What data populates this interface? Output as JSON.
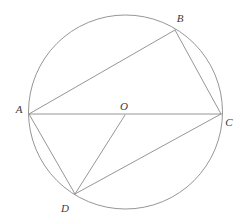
{
  "figure": {
    "background_color": "#ffffff",
    "stroke_color": "#8a8a8a",
    "label_color": "#3a3a3a",
    "stroke_width": 0.9
  },
  "circle": {
    "name": "circumscribed-circle",
    "cx": 125.5,
    "cy": 112,
    "r": 97
  },
  "points": [
    {
      "id": "A",
      "label": "A",
      "x": 29,
      "y": 114,
      "label_x": 19,
      "label_y": 113,
      "role": "vertex"
    },
    {
      "id": "B",
      "label": "B",
      "x": 175,
      "y": 30,
      "label_x": 180,
      "label_y": 22,
      "role": "vertex"
    },
    {
      "id": "C",
      "label": "C",
      "x": 221,
      "y": 114,
      "label_x": 229,
      "label_y": 126,
      "role": "vertex"
    },
    {
      "id": "D",
      "label": "D",
      "x": 75,
      "y": 194,
      "label_x": 65,
      "label_y": 212,
      "role": "vertex"
    },
    {
      "id": "O",
      "label": "O",
      "x": 125,
      "y": 115,
      "label_x": 124,
      "label_y": 110,
      "role": "center"
    }
  ],
  "segments": [
    {
      "name": "segment-AB",
      "from": "A",
      "to": "B",
      "x1": 29,
      "y1": 114,
      "x2": 175,
      "y2": 30
    },
    {
      "name": "segment-BC",
      "from": "B",
      "to": "C",
      "x1": 175,
      "y1": 30,
      "x2": 221,
      "y2": 114
    },
    {
      "name": "segment-AC",
      "from": "A",
      "to": "C",
      "x1": 29,
      "y1": 114,
      "x2": 221,
      "y2": 114
    },
    {
      "name": "segment-AD",
      "from": "A",
      "to": "D",
      "x1": 29,
      "y1": 114,
      "x2": 75,
      "y2": 194
    },
    {
      "name": "segment-DC",
      "from": "D",
      "to": "C",
      "x1": 75,
      "y1": 194,
      "x2": 221,
      "y2": 114
    },
    {
      "name": "segment-OD",
      "from": "O",
      "to": "D",
      "x1": 125,
      "y1": 115,
      "x2": 75,
      "y2": 194
    }
  ]
}
